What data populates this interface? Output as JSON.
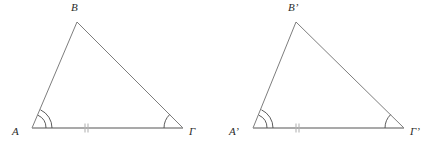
{
  "figure": {
    "kind": "geometry-diagram",
    "background_color": "#ffffff",
    "stroke_color": "#6e6e6e",
    "base_stroke_color": "#8c8c8c",
    "arc_color": "#4a4a4a",
    "tick_color": "#b5b5b5",
    "label_color": "#2b2b2b"
  },
  "triangles": [
    {
      "id": "triangle-left",
      "name": "triangle-ABG",
      "vertices": {
        "A": {
          "label": "A",
          "x": 32,
          "y": 128,
          "label_x": 12,
          "label_y": 126
        },
        "B": {
          "label": "B",
          "x": 77,
          "y": 22,
          "label_x": 71,
          "label_y": 2
        },
        "G": {
          "label": "Γ",
          "x": 183,
          "y": 128,
          "label_x": 189,
          "label_y": 126
        }
      },
      "angle_marks": {
        "A": {
          "arcs": 2,
          "name": "angle-arc-A"
        },
        "G": {
          "arcs": 1,
          "name": "angle-arc-gamma"
        }
      },
      "base_tick": {
        "count": 2,
        "x": 86,
        "y": 128,
        "name": "base-tick-mark"
      }
    },
    {
      "id": "triangle-right",
      "name": "triangle-ABG-prime",
      "vertices": {
        "A": {
          "label": "A’",
          "x": 253,
          "y": 128,
          "label_x": 229,
          "label_y": 126
        },
        "B": {
          "label": "B’",
          "x": 296,
          "y": 22,
          "label_x": 288,
          "label_y": 2
        },
        "G": {
          "label": "Γ’",
          "x": 404,
          "y": 128,
          "label_x": 410,
          "label_y": 126
        }
      },
      "angle_marks": {
        "A": {
          "arcs": 2,
          "name": "angle-arc-A-prime"
        },
        "G": {
          "arcs": 1,
          "name": "angle-arc-gamma-prime"
        }
      },
      "base_tick": {
        "count": 2,
        "x": 297,
        "y": 128,
        "name": "base-tick-mark-prime"
      }
    }
  ]
}
